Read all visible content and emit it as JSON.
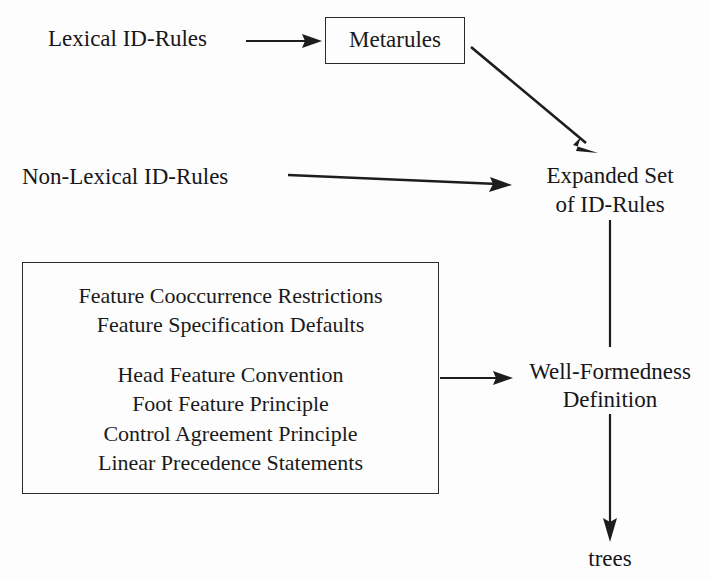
{
  "diagram": {
    "ink_color": "#1d1d1d",
    "background_color": "#fdfdfd",
    "nodes": {
      "lexical_id_rules": "Lexical ID-Rules",
      "metarules": "Metarules",
      "non_lexical_id_rules": "Non-Lexical ID-Rules",
      "expanded_set_line1": "Expanded Set",
      "expanded_set_line2": "of ID-Rules",
      "well_formedness_line1": "Well-Formedness",
      "well_formedness_line2": "Definition",
      "trees": "trees"
    },
    "principles_box": {
      "group1": [
        "Feature Cooccurrence Restrictions",
        "Feature Specification Defaults"
      ],
      "group2": [
        "Head Feature Convention",
        "Foot Feature Principle",
        "Control Agreement Principle",
        "Linear Precedence Statements"
      ]
    },
    "edges": [
      {
        "name": "lexical-to-metarules",
        "kind": "arrow",
        "label": ""
      },
      {
        "name": "metarules-to-expanded-set",
        "kind": "arrow",
        "label": ""
      },
      {
        "name": "non-lexical-to-expanded-set",
        "kind": "arrow",
        "label": ""
      },
      {
        "name": "expanded-set-to-well-formedness",
        "kind": "line",
        "label": ""
      },
      {
        "name": "principles-to-well-formedness",
        "kind": "arrow",
        "label": ""
      },
      {
        "name": "well-formedness-to-trees",
        "kind": "arrow",
        "label": ""
      }
    ]
  }
}
